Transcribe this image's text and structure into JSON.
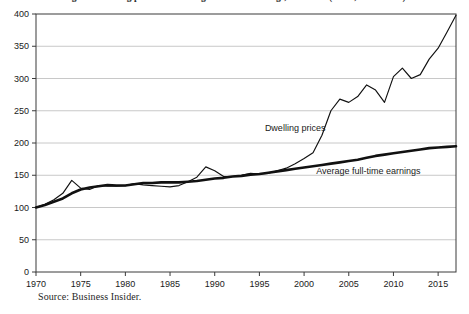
{
  "figure": {
    "title": "Figure: Dwelling prices and average full-time earnings, Australia (index, 1970 = 100)",
    "source_note": "Source: Business Insider."
  },
  "chart_data": {
    "type": "line",
    "xlabel": "",
    "ylabel": "",
    "xlim": [
      1970,
      2017
    ],
    "ylim": [
      0,
      400
    ],
    "xticks": [
      1970,
      1975,
      1980,
      1985,
      1990,
      1995,
      2000,
      2005,
      2010,
      2015
    ],
    "yticks": [
      0,
      50,
      100,
      150,
      200,
      250,
      300,
      350,
      400
    ],
    "grid": "horizontal",
    "legend": "inline-annotations",
    "annotations": [
      {
        "text": "Dwelling prices",
        "x": 1999.0,
        "y": 218
      },
      {
        "text": "Average full-time earnings",
        "x": 2007.2,
        "y": 152
      }
    ],
    "series": [
      {
        "name": "Dwelling prices",
        "style": "thin",
        "color": "#111111",
        "x": [
          1970,
          1971,
          1972,
          1973,
          1974,
          1975,
          1976,
          1977,
          1978,
          1979,
          1980,
          1981,
          1982,
          1983,
          1984,
          1985,
          1986,
          1987,
          1988,
          1989,
          1990,
          1991,
          1992,
          1993,
          1994,
          1995,
          1996,
          1997,
          1998,
          1999,
          2000,
          2001,
          2002,
          2003,
          2004,
          2005,
          2006,
          2007,
          2008,
          2009,
          2010,
          2011,
          2012,
          2013,
          2014,
          2015,
          2016,
          2017
        ],
        "values": [
          100,
          105,
          112,
          122,
          142,
          130,
          128,
          134,
          133,
          133,
          134,
          137,
          135,
          134,
          133,
          132,
          134,
          140,
          147,
          163,
          157,
          148,
          148,
          150,
          153,
          152,
          153,
          157,
          161,
          168,
          176,
          185,
          212,
          250,
          268,
          263,
          272,
          290,
          282,
          263,
          303,
          316,
          300,
          306,
          330,
          347,
          372,
          398
        ]
      },
      {
        "name": "Average full-time earnings",
        "style": "thick",
        "color": "#111111",
        "x": [
          1970,
          1971,
          1972,
          1973,
          1974,
          1975,
          1976,
          1977,
          1978,
          1979,
          1980,
          1981,
          1982,
          1983,
          1984,
          1985,
          1986,
          1987,
          1988,
          1989,
          1990,
          1991,
          1992,
          1993,
          1994,
          1995,
          1996,
          1997,
          1998,
          1999,
          2000,
          2001,
          2002,
          2003,
          2004,
          2005,
          2006,
          2007,
          2008,
          2009,
          2010,
          2011,
          2012,
          2013,
          2014,
          2015,
          2016,
          2017
        ],
        "values": [
          100,
          104,
          109,
          114,
          122,
          128,
          131,
          133,
          135,
          134,
          134,
          136,
          138,
          138,
          139,
          139,
          139,
          140,
          141,
          143,
          145,
          146,
          148,
          149,
          151,
          152,
          154,
          156,
          158,
          160,
          162,
          164,
          166,
          168,
          170,
          172,
          174,
          177,
          180,
          182,
          184,
          186,
          188,
          190,
          192,
          193,
          194,
          195
        ]
      }
    ]
  }
}
